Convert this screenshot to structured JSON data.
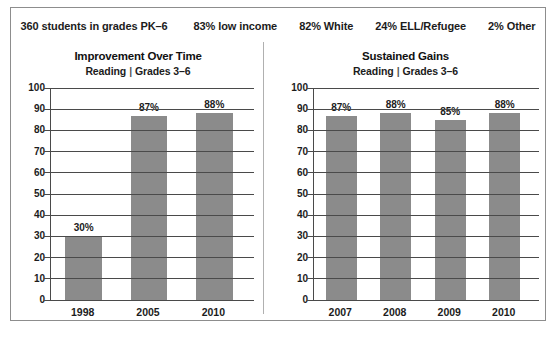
{
  "stats": [
    "360 students in grades PK–6",
    "83% low income",
    "82% White",
    "24% ELL/Refugee",
    "2% Other"
  ],
  "panels": {
    "left": {
      "title": "Improvement Over Time",
      "subject": "Reading",
      "separator": "|",
      "grades": "Grades 3–6"
    },
    "right": {
      "title": "Sustained Gains",
      "subject": "Reading",
      "separator": "|",
      "grades": "Grades 3–6"
    }
  },
  "axis": {
    "yticks": [
      "100",
      "90",
      "80",
      "70",
      "60",
      "50",
      "40",
      "30",
      "20",
      "10",
      "0"
    ]
  },
  "colors": {
    "bar": "#8b8b8b",
    "axis": "#4a4a4a",
    "border": "#8d8d8d",
    "text": "#1c1c1c"
  },
  "chart_data": [
    {
      "type": "bar",
      "title": "Improvement Over Time",
      "subtitle": "Reading  |  Grades 3–6",
      "categories": [
        "1998",
        "2005",
        "2010"
      ],
      "values": [
        30,
        87,
        88
      ],
      "labels": [
        "30%",
        "87%",
        "88%"
      ],
      "xlabel": "",
      "ylabel": "",
      "ylim": [
        0,
        100
      ],
      "ytick_step": 10,
      "grid": true,
      "legend": "none"
    },
    {
      "type": "bar",
      "title": "Sustained Gains",
      "subtitle": "Reading  |  Grades 3–6",
      "categories": [
        "2007",
        "2008",
        "2009",
        "2010"
      ],
      "values": [
        87,
        88,
        85,
        88
      ],
      "labels": [
        "87%",
        "88%",
        "85%",
        "88%"
      ],
      "xlabel": "",
      "ylabel": "",
      "ylim": [
        0,
        100
      ],
      "ytick_step": 10,
      "grid": true,
      "legend": "none"
    }
  ]
}
